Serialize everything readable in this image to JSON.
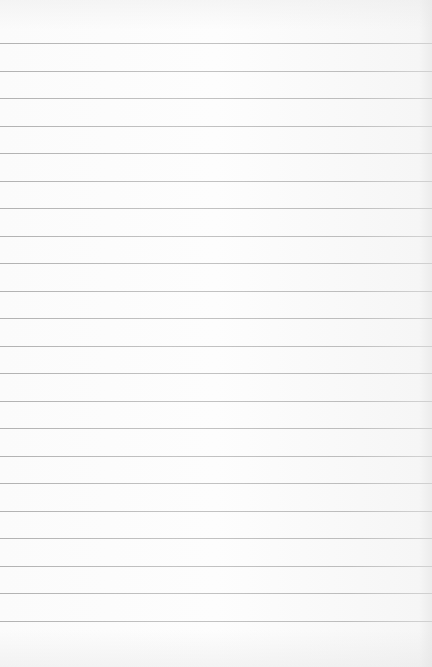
{
  "page": {
    "type": "lined-paper",
    "background_color": "#fcfcfc",
    "line_color": "#a8a8a8",
    "first_line_y": 43,
    "line_spacing": 27.5,
    "line_count": 22
  }
}
